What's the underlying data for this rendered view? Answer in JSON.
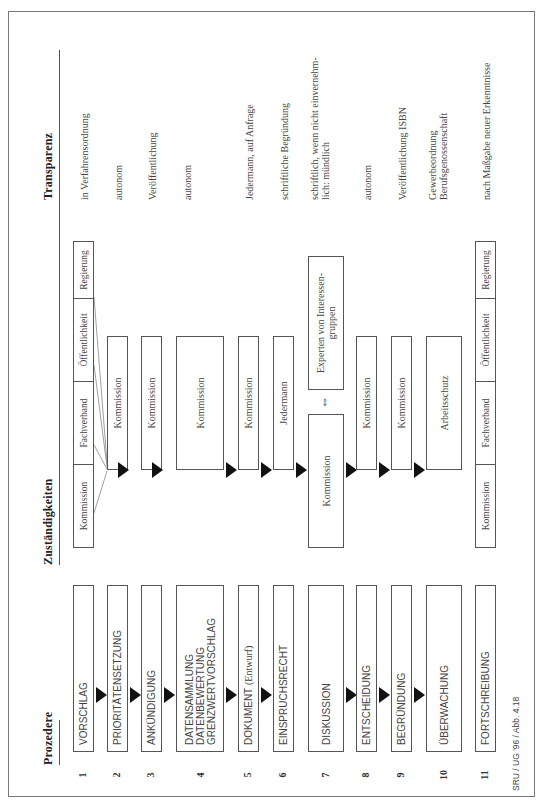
{
  "headers": {
    "procedure": "Prozedere",
    "responsibilities": "Zuständigkeiten",
    "transparency": "Transparenz"
  },
  "stakeholders": [
    "Kommission",
    "Fachverband",
    "Öffentlichkeit",
    "Regierung"
  ],
  "rows": [
    {
      "num": "1",
      "step": "VORSCHLAG",
      "responsible": "",
      "transparency": "in Verfahrensordnung"
    },
    {
      "num": "2",
      "step": "PRIORITÄTENSETZUNG",
      "responsible": "Kommission",
      "transparency": "autonom"
    },
    {
      "num": "3",
      "step": "ANKÜNDIGUNG",
      "responsible": "Kommission",
      "transparency": "Veröffentlichung"
    },
    {
      "num": "4",
      "step_lines": [
        "DATENSAMMLUNG",
        "DATENBEWERTUNG",
        "GRENZWERTVORSCHLAG"
      ],
      "responsible": "Kommission",
      "transparency": "autonom"
    },
    {
      "num": "5",
      "step": "DOKUMENT",
      "step_suffix": "(Entwurf)",
      "responsible": "Kommission",
      "transparency": "Jedermann, auf Anfrage"
    },
    {
      "num": "6",
      "step": "EINSPRUCHSRECHT",
      "responsible": "Jedermann",
      "transparency": "schriftliche Begründung"
    },
    {
      "num": "7",
      "step": "DISKUSSION",
      "responsible_left": "Kommission",
      "responsible_right": "Experten von Interessen-gruppen",
      "exchange_icon": "⇔",
      "transparency_lines": [
        "schriftlich, wenn nicht einvernehm-",
        "lich: mündlich"
      ]
    },
    {
      "num": "8",
      "step": "ENTSCHEIDUNG",
      "responsible": "Kommission",
      "transparency": "autonom"
    },
    {
      "num": "9",
      "step": "BEGRÜNDUNG",
      "responsible": "Kommission",
      "transparency": "Veröffentlichung ISBN"
    },
    {
      "num": "10",
      "step": "ÜBERWACHUNG",
      "responsible": "Arbeitsschutz",
      "transparency_lines": [
        "Gewerbeordnung",
        "Berufsgenossenschaft"
      ]
    },
    {
      "num": "11",
      "step": "FORTSCHREIBUNG",
      "responsible": "",
      "transparency": "nach Maßgabe neuer Erkenntnisse"
    }
  ],
  "footer": "SRU / UG '96 / Abb. 4.18"
}
